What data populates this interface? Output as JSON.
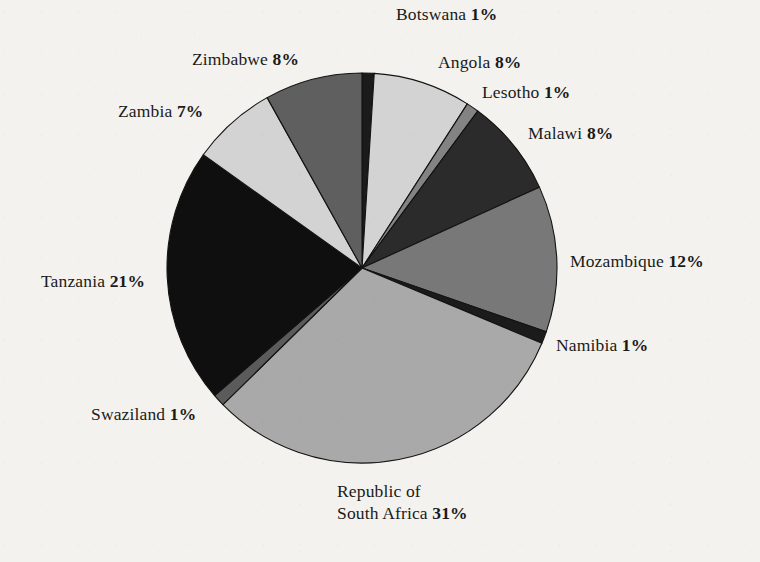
{
  "chart_data": {
    "type": "pie",
    "title": "",
    "subtitle": "",
    "xlabel": "",
    "ylabel": "",
    "units": "percent",
    "legend_position": "none",
    "grid": false,
    "label_format": "{name} {value}%",
    "start_angle_deg": 0,
    "direction": "clockwise",
    "categories": [
      "Botswana",
      "Angola",
      "Lesotho",
      "Malawi",
      "Mozambique",
      "Namibia",
      "Republic of South Africa",
      "Swaziland",
      "Tanzania",
      "Zambia",
      "Zimbabwe"
    ],
    "values": [
      1,
      8,
      1,
      8,
      12,
      1,
      31,
      1,
      21,
      7,
      8
    ],
    "total": 99,
    "slices": [
      {
        "name": "Botswana",
        "label_name": "Botswana",
        "value": 1,
        "value_text": "1%",
        "color": "#1b1b1b",
        "start_deg": 0,
        "end_deg": 3.6
      },
      {
        "name": "Angola",
        "label_name": "Angola",
        "value": 8,
        "value_text": "8%",
        "color": "#d3d3d3",
        "start_deg": 3.6,
        "end_deg": 32.7
      },
      {
        "name": "Lesotho",
        "label_name": "Lesotho",
        "value": 1,
        "value_text": "1%",
        "color": "#838383",
        "start_deg": 32.7,
        "end_deg": 36.4
      },
      {
        "name": "Malawi",
        "label_name": "Malawi",
        "value": 8,
        "value_text": "8%",
        "color": "#2b2b2b",
        "start_deg": 36.4,
        "end_deg": 65.5
      },
      {
        "name": "Mozambique",
        "label_name": "Mozambique",
        "value": 12,
        "value_text": "12%",
        "color": "#787878",
        "start_deg": 65.5,
        "end_deg": 109.1
      },
      {
        "name": "Namibia",
        "label_name": "Namibia",
        "value": 1,
        "value_text": "1%",
        "color": "#1b1b1b",
        "start_deg": 109.1,
        "end_deg": 112.7
      },
      {
        "name": "Republic of South Africa",
        "label_name": "Republic of\nSouth Africa",
        "label_line1": "Republic of",
        "label_line2": "South Africa",
        "value": 31,
        "value_text": "31%",
        "color": "#a9a9a9",
        "start_deg": 112.7,
        "end_deg": 225.5
      },
      {
        "name": "Swaziland",
        "label_name": "Swaziland",
        "value": 1,
        "value_text": "1%",
        "color": "#5b5b5b",
        "start_deg": 225.5,
        "end_deg": 229.1
      },
      {
        "name": "Tanzania",
        "label_name": "Tanzania",
        "value": 21,
        "value_text": "21%",
        "color": "#100f0f",
        "start_deg": 229.1,
        "end_deg": 305.5
      },
      {
        "name": "Zambia",
        "label_name": "Zambia",
        "value": 7,
        "value_text": "7%",
        "color": "#d3d3d3",
        "start_deg": 305.5,
        "end_deg": 330.9
      },
      {
        "name": "Zimbabwe",
        "label_name": "Zimbabwe",
        "value": 8,
        "value_text": "8%",
        "color": "#5f5f5f",
        "start_deg": 330.9,
        "end_deg": 360
      }
    ]
  },
  "labels": {
    "botswana": {
      "name": "Botswana",
      "pct": "1%"
    },
    "angola": {
      "name": "Angola",
      "pct": "8%"
    },
    "lesotho": {
      "name": "Lesotho",
      "pct": "1%"
    },
    "malawi": {
      "name": "Malawi",
      "pct": "8%"
    },
    "mozambique": {
      "name": "Mozambique",
      "pct": "12%"
    },
    "namibia": {
      "name": "Namibia",
      "pct": "1%"
    },
    "south_africa": {
      "line1": "Republic of",
      "line2": "South Africa",
      "pct": "31%"
    },
    "swaziland": {
      "name": "Swaziland",
      "pct": "1%"
    },
    "tanzania": {
      "name": "Tanzania",
      "pct": "21%"
    },
    "zambia": {
      "name": "Zambia",
      "pct": "7%"
    },
    "zimbabwe": {
      "name": "Zimbabwe",
      "pct": "8%"
    }
  },
  "geometry": {
    "center_x": 362,
    "center_y": 268,
    "radius": 195
  },
  "colors": {
    "background": "#f3f2ef",
    "outline": "#141312",
    "text": "#1b1a18"
  }
}
